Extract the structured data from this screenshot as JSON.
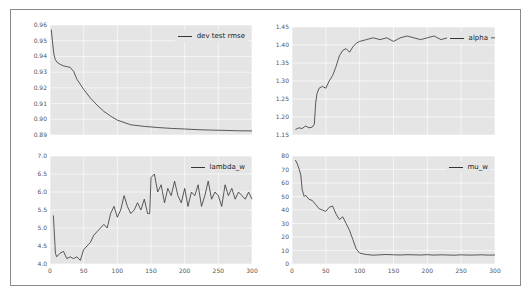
{
  "chart_data": [
    {
      "type": "line",
      "title": "",
      "legend": [
        "dev test rmse"
      ],
      "legend_position": "upper right",
      "grid": true,
      "xlim": [
        0,
        300
      ],
      "ylim": [
        0.89,
        0.96
      ],
      "yticks": [
        "0.96",
        "0.95",
        "0.94",
        "0.93",
        "0.92",
        "0.91",
        "0.90",
        "0.89"
      ],
      "xticks": [
        "",
        "",
        "",
        "",
        "",
        "",
        ""
      ],
      "series": [
        {
          "name": "dev test rmse",
          "x": [
            2,
            4,
            6,
            8,
            10,
            15,
            20,
            25,
            30,
            35,
            40,
            50,
            60,
            70,
            80,
            90,
            100,
            120,
            140,
            160,
            180,
            200,
            220,
            240,
            260,
            280,
            300
          ],
          "values": [
            0.957,
            0.948,
            0.941,
            0.938,
            0.9365,
            0.935,
            0.934,
            0.9335,
            0.933,
            0.9305,
            0.9255,
            0.919,
            0.9135,
            0.909,
            0.905,
            0.902,
            0.8995,
            0.8965,
            0.8955,
            0.8948,
            0.8942,
            0.8938,
            0.8934,
            0.8931,
            0.8929,
            0.8927,
            0.8926
          ]
        }
      ]
    },
    {
      "type": "line",
      "title": "",
      "legend": [
        "alpha"
      ],
      "legend_position": "upper right",
      "grid": true,
      "xlim": [
        0,
        300
      ],
      "ylim": [
        1.15,
        1.45
      ],
      "yticks": [
        "1.45",
        "1.40",
        "1.35",
        "1.30",
        "1.25",
        "1.20",
        "1.15"
      ],
      "xticks": [
        "",
        "",
        "",
        "",
        "",
        "",
        ""
      ],
      "series": [
        {
          "name": "alpha",
          "x": [
            5,
            10,
            15,
            20,
            25,
            30,
            33,
            35,
            37,
            40,
            45,
            50,
            55,
            60,
            65,
            70,
            75,
            80,
            85,
            90,
            95,
            100,
            110,
            120,
            130,
            140,
            150,
            160,
            170,
            180,
            190,
            200,
            210,
            220,
            230,
            240,
            250,
            260,
            270,
            280,
            290,
            300
          ],
          "values": [
            1.165,
            1.17,
            1.168,
            1.175,
            1.17,
            1.172,
            1.18,
            1.24,
            1.265,
            1.28,
            1.285,
            1.28,
            1.3,
            1.315,
            1.34,
            1.37,
            1.385,
            1.39,
            1.38,
            1.395,
            1.405,
            1.41,
            1.415,
            1.42,
            1.415,
            1.42,
            1.41,
            1.42,
            1.425,
            1.42,
            1.415,
            1.42,
            1.425,
            1.415,
            1.42,
            1.42,
            1.415,
            1.42,
            1.425,
            1.42,
            1.42,
            1.42
          ]
        }
      ]
    },
    {
      "type": "line",
      "title": "",
      "legend": [
        "lambda_w"
      ],
      "legend_position": "upper right",
      "grid": true,
      "xlim": [
        0,
        300
      ],
      "ylim": [
        4.0,
        7.0
      ],
      "yticks": [
        "7.0",
        "6.5",
        "6.0",
        "5.5",
        "5.0",
        "4.5",
        "4.0"
      ],
      "xticks": [
        "0",
        "50",
        "100",
        "150",
        "200",
        "250",
        "300"
      ],
      "series": [
        {
          "name": "lambda_w",
          "x": [
            5,
            8,
            10,
            15,
            20,
            25,
            30,
            35,
            40,
            45,
            50,
            55,
            60,
            65,
            70,
            75,
            80,
            85,
            90,
            95,
            100,
            105,
            110,
            115,
            120,
            125,
            130,
            135,
            140,
            145,
            148,
            150,
            155,
            160,
            165,
            170,
            175,
            180,
            185,
            190,
            195,
            200,
            205,
            210,
            215,
            220,
            225,
            230,
            235,
            240,
            245,
            250,
            255,
            260,
            265,
            270,
            275,
            280,
            285,
            290,
            295,
            300
          ],
          "values": [
            5.35,
            4.3,
            4.2,
            4.3,
            4.35,
            4.15,
            4.2,
            4.15,
            4.2,
            4.1,
            4.4,
            4.5,
            4.6,
            4.8,
            4.9,
            5.0,
            5.1,
            5.0,
            5.4,
            5.6,
            5.3,
            5.5,
            5.9,
            5.6,
            5.4,
            5.5,
            5.7,
            5.5,
            5.8,
            5.4,
            5.4,
            6.4,
            6.5,
            6.0,
            6.2,
            5.7,
            6.1,
            5.9,
            6.3,
            5.9,
            5.7,
            6.1,
            5.6,
            6.0,
            5.9,
            6.2,
            5.6,
            5.9,
            6.3,
            5.8,
            6.0,
            5.9,
            5.6,
            6.2,
            5.9,
            6.1,
            5.8,
            6.0,
            5.9,
            5.8,
            6.0,
            5.8
          ]
        }
      ]
    },
    {
      "type": "line",
      "title": "",
      "legend": [
        "mu_w"
      ],
      "legend_position": "upper right",
      "grid": true,
      "xlim": [
        0,
        300
      ],
      "ylim": [
        0,
        80
      ],
      "yticks": [
        "80",
        "70",
        "60",
        "50",
        "40",
        "30",
        "20",
        "10",
        "0"
      ],
      "xticks": [
        "0",
        "50",
        "100",
        "150",
        "200",
        "250",
        "300"
      ],
      "series": [
        {
          "name": "mu_w",
          "x": [
            5,
            8,
            10,
            13,
            15,
            18,
            20,
            25,
            30,
            35,
            40,
            45,
            50,
            55,
            60,
            65,
            70,
            75,
            80,
            85,
            90,
            95,
            100,
            105,
            110,
            120,
            130,
            140,
            150,
            160,
            170,
            180,
            190,
            200,
            210,
            220,
            230,
            240,
            250,
            260,
            270,
            280,
            290,
            300
          ],
          "values": [
            77,
            74,
            71,
            66,
            55,
            50,
            51,
            48,
            47,
            44,
            41,
            40,
            39,
            42,
            43,
            37,
            33,
            35,
            30,
            25,
            18,
            11,
            8,
            7.5,
            7,
            6.5,
            6.8,
            7,
            6.8,
            6.7,
            6.9,
            6.8,
            6.7,
            6.9,
            6.6,
            6.8,
            6.7,
            6.5,
            6.8,
            6.6,
            6.7,
            6.8,
            6.6,
            6.7
          ]
        }
      ]
    }
  ]
}
